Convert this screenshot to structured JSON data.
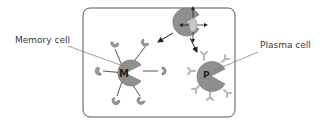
{
  "diagram": {
    "labels": {
      "memory_cell": "Memory cell",
      "plasma_cell": "Plasma cell"
    },
    "cells": {
      "memory": {
        "letter": "M"
      },
      "plasma": {
        "letter": "P"
      }
    },
    "colors": {
      "cell_fill": "#8f8f8f",
      "receptor_fill": "#9a9a9a",
      "antibody_fill": "#b9b9b9",
      "antigen_fill": "#c8c8c8",
      "box_stroke": "#555555",
      "line": "#333333"
    }
  }
}
